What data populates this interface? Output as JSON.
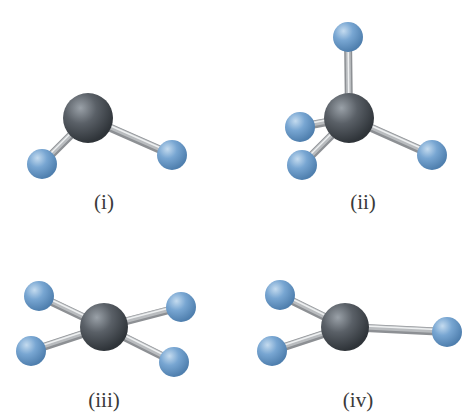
{
  "colors": {
    "central_atom": "#4a5056",
    "central_highlight": "#9aa1a8",
    "outer_atom": "#6f9ecb",
    "outer_highlight": "#c4dbef",
    "outer_shadow": "#4f7fae",
    "bond": "#b9bcbf",
    "bond_highlight": "#eef0f1",
    "label": "#3a3a3a"
  },
  "molecules": [
    {
      "label": "(i)",
      "label_pos": [
        104,
        190
      ],
      "central": {
        "x": 88,
        "y": 118,
        "r": 25
      },
      "outer": [
        {
          "x": 42,
          "y": 164,
          "r": 15
        },
        {
          "x": 172,
          "y": 155,
          "r": 15
        }
      ]
    },
    {
      "label": "(ii)",
      "label_pos": [
        363,
        190
      ],
      "central": {
        "x": 349,
        "y": 118,
        "r": 25
      },
      "outer": [
        {
          "x": 348,
          "y": 37,
          "r": 15
        },
        {
          "x": 300,
          "y": 127,
          "r": 15
        },
        {
          "x": 302,
          "y": 165,
          "r": 15
        },
        {
          "x": 432,
          "y": 155,
          "r": 15
        }
      ]
    },
    {
      "label": "(iii)",
      "label_pos": [
        104,
        388
      ],
      "central": {
        "x": 104,
        "y": 327,
        "r": 24
      },
      "outer": [
        {
          "x": 39,
          "y": 296,
          "r": 15
        },
        {
          "x": 31,
          "y": 351,
          "r": 15
        },
        {
          "x": 181,
          "y": 307,
          "r": 15
        },
        {
          "x": 174,
          "y": 362,
          "r": 15
        }
      ]
    },
    {
      "label": "(iv)",
      "label_pos": [
        358,
        388
      ],
      "central": {
        "x": 345,
        "y": 327,
        "r": 24
      },
      "outer": [
        {
          "x": 280,
          "y": 295,
          "r": 15
        },
        {
          "x": 272,
          "y": 351,
          "r": 15
        },
        {
          "x": 447,
          "y": 332,
          "r": 15
        }
      ]
    }
  ]
}
